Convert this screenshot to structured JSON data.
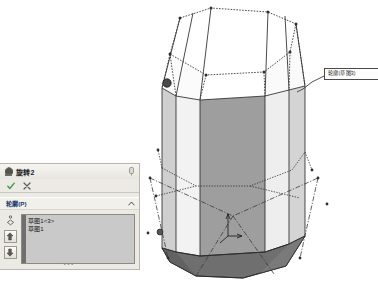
{
  "app": {
    "kind": "cad-modeling",
    "viewport_background": "#ffffff"
  },
  "property_manager": {
    "title": "旋转2",
    "title_icon": "revolve-feature-icon",
    "pin_icon": "pin-icon",
    "confirm": {
      "ok_label": "✓",
      "ok_name": "ok-button",
      "ok_color": "#3f9142",
      "cancel_label": "✕",
      "cancel_name": "cancel-button",
      "cancel_color": "#5a5a5a"
    },
    "section": {
      "title": "轮廓(P)",
      "collapse_icon": "chevron-up-icon",
      "collapsed": false
    },
    "gutter": {
      "contour_select_icon": "contour-select-icon",
      "move_up_label": "↑",
      "move_down_label": "↓"
    },
    "contour_list": {
      "items": [
        {
          "label": "草图1<3>"
        },
        {
          "label": "草图1"
        }
      ]
    },
    "resize_grip": "•••"
  },
  "callout": {
    "label": "轮廓(草图3)",
    "leader_from": {
      "x": 324,
      "y": 76
    },
    "leader_to": {
      "x": 307,
      "y": 88
    }
  },
  "model": {
    "type": "revolved-octagonal-solid",
    "colors": {
      "face_light": "#f4f4f4",
      "face_mid": "#d8d8d8",
      "face_dark": "#9c9c9c",
      "face_darker": "#8c8c8c",
      "chamfer_dark": "#6f6f6f",
      "edge": "#2b2b2b",
      "sketch_line": "#3a3a3a",
      "selected_vertex": "#444444"
    },
    "selected_vertex": {
      "x": 167,
      "y": 83
    },
    "triad": {
      "origin": {
        "x": 228,
        "y": 236
      },
      "y_axis_label": "",
      "x_axis_label": ""
    }
  }
}
